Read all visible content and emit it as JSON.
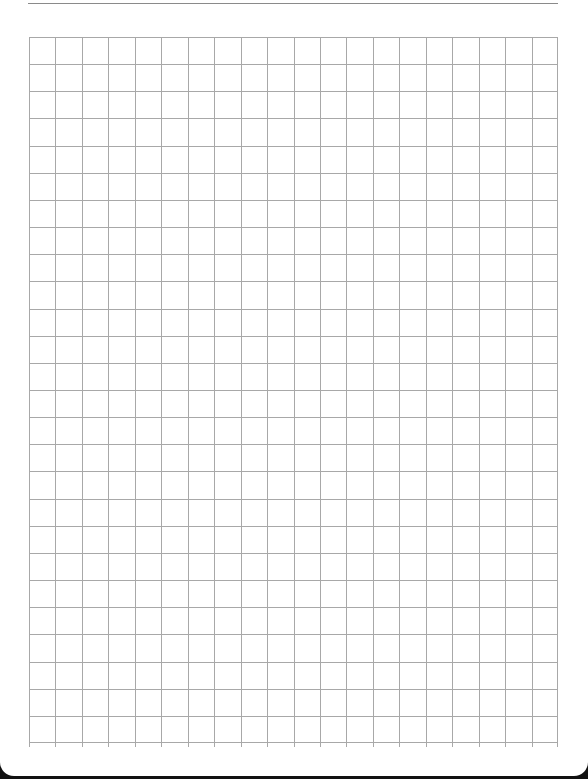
{
  "document": {
    "type": "graph paper",
    "header_faint_text": "",
    "footer_faint_text": ""
  },
  "grid": {
    "columns": 20,
    "rows": 26,
    "line_color": "#a8a8a8",
    "background": "#ffffff"
  }
}
